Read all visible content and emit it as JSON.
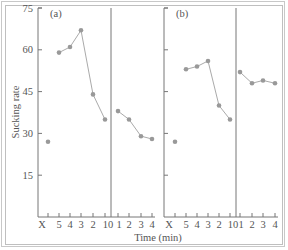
{
  "chart_data": {
    "type": "line",
    "ylabel": "Sucking rate",
    "xlabel": "Time (min)",
    "ylim": [
      0,
      75
    ],
    "yticks": [
      15,
      30,
      45,
      60,
      75
    ],
    "x_categories": [
      "X",
      "5",
      "4",
      "3",
      "2",
      "1",
      "0",
      "1",
      "2",
      "3",
      "4"
    ],
    "x_tick_labels_rendered": [
      "X",
      "5",
      "4",
      "3",
      "2",
      "10",
      "1",
      "2",
      "3",
      "4"
    ],
    "legend": [],
    "grid": false,
    "panels": [
      {
        "label": "(a)",
        "baseline": {
          "x": "X",
          "value": 27
        },
        "before": {
          "x": [
            "5",
            "4",
            "3",
            "2",
            "1"
          ],
          "values": [
            59,
            61,
            67,
            44,
            35
          ]
        },
        "after": {
          "x": [
            "1",
            "2",
            "3",
            "4"
          ],
          "values": [
            38,
            35,
            29,
            28
          ]
        }
      },
      {
        "label": "(b)",
        "baseline": {
          "x": "X",
          "value": 27
        },
        "before": {
          "x": [
            "5",
            "4",
            "3",
            "2",
            "1"
          ],
          "values": [
            53,
            54,
            56,
            40,
            35
          ]
        },
        "after": {
          "x": [
            "1",
            "2",
            "3",
            "4"
          ],
          "values": [
            52,
            48,
            49,
            48
          ]
        }
      }
    ]
  },
  "colors": {
    "axis": "#777777",
    "line": "#aaaaaa",
    "marker": "#999999",
    "text": "#555555"
  }
}
